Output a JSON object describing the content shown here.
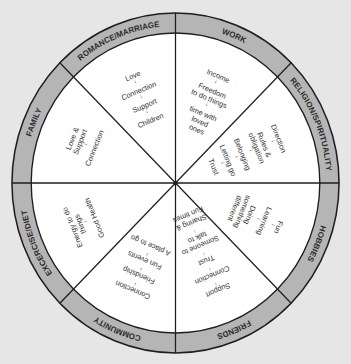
{
  "diagram": {
    "type": "wheel",
    "colors": {
      "background": "#e6e6e6",
      "ring": "#b5b5b5",
      "inner": "#ffffff",
      "stroke": "#1e1e1e",
      "text": "#333333"
    },
    "sectors": [
      {
        "label": "ROMANCE/MARRIAGE",
        "items": [
          "Love",
          "Connection",
          "Support",
          "Children"
        ]
      },
      {
        "label": "WORK",
        "items": [
          "Income",
          "Freedom",
          "to do things",
          "time with",
          "loved",
          "ones"
        ]
      },
      {
        "label": "RELIGION/SPIRITUALITY",
        "items": [
          "Direction",
          "Rules &",
          "obligation",
          "Belonging",
          "Letting go",
          "Trust"
        ]
      },
      {
        "label": "HOBBIES",
        "items": [
          "Fun",
          "Learning",
          "Doing",
          "something",
          "different"
        ]
      },
      {
        "label": "FRIENDS",
        "items": [
          "Support",
          "Connection",
          "Trust",
          "Someone to",
          "talk to",
          "Sharing &",
          "Fun times"
        ]
      },
      {
        "label": "COMMUNITY",
        "items": [
          "Connection",
          "Friendship",
          "Fun events",
          "A place to go"
        ]
      },
      {
        "label": "EXCERCISE/DIET",
        "items": [
          "Energy to do",
          "things",
          "Good Health"
        ]
      },
      {
        "label": "FAMILY",
        "items": [
          "Love &",
          "Support",
          "Connection"
        ]
      }
    ],
    "arrow_glyph": "↓"
  }
}
